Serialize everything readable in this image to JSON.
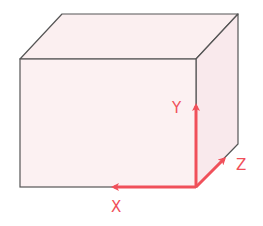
{
  "diagram": {
    "colors": {
      "face_fill": "#fbeff0",
      "edge": "#555555",
      "axis": "#f0505a"
    },
    "axes": {
      "x_label": "X",
      "y_label": "Y",
      "z_label": "Z"
    }
  }
}
